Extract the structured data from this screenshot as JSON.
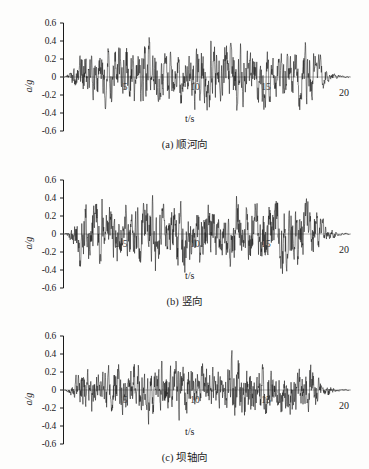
{
  "figure": {
    "background_color": "#fdfdfc",
    "ink_color": "#1a1a1a",
    "baseline_color": "#9a9a9a"
  },
  "axis": {
    "y_label_text": "a/g",
    "x_label_text": "t/s",
    "y_ticks": [
      "0.6",
      "0.4",
      "0.2",
      "0",
      "-0.2",
      "-0.4",
      "-0.6"
    ],
    "x_ticks": [
      "5",
      "10",
      "15"
    ],
    "x_end_label": "20",
    "y_min": -0.6,
    "y_max": 0.6,
    "x_min": 0,
    "x_max": 20
  },
  "panels": [
    {
      "id": "a",
      "caption_index": "(a)",
      "caption_text": "顺河向",
      "seed": 1733,
      "peak": 0.44,
      "trough": -0.42
    },
    {
      "id": "b",
      "caption_index": "(b)",
      "caption_text": "竖向",
      "seed": 90217,
      "peak": 0.43,
      "trough": -0.45
    },
    {
      "id": "c",
      "caption_index": "(c)",
      "caption_text": "坝轴向",
      "seed": 44501,
      "peak": 0.44,
      "trough": -0.42
    }
  ],
  "chart_data": {
    "type": "line",
    "title": "",
    "xlabel": "t/s",
    "ylabel": "a/g",
    "xlim": [
      0,
      20
    ],
    "ylim": [
      -0.6,
      0.6
    ],
    "grid": false,
    "legend": "none",
    "x_tick_values": [
      5,
      10,
      15,
      20
    ],
    "y_tick_values": [
      -0.6,
      -0.4,
      -0.2,
      0,
      0.2,
      0.4,
      0.6
    ],
    "series": [
      {
        "name": "(a) 顺河向",
        "description": "Acceleration time history, stream-flow direction",
        "sampling_interval_s": 0.02,
        "duration_s": 20,
        "peak_positive_g": 0.44,
        "peak_negative_g": -0.42,
        "envelope_description": "noise burst rising to full amplitude by ~1.5 s, sustained to ~17 s, decaying to near zero at 20 s",
        "values_note": "dense random seismic trace; reconstructed procedurally from seed with matching envelope and peak amplitudes"
      },
      {
        "name": "(b) 竖向",
        "description": "Acceleration time history, vertical direction",
        "sampling_interval_s": 0.02,
        "duration_s": 20,
        "peak_positive_g": 0.43,
        "peak_negative_g": -0.45,
        "envelope_description": "noise burst rising to full amplitude by ~1.5 s, sustained to ~17.5 s, decaying to near zero at 20 s",
        "values_note": "dense random seismic trace; reconstructed procedurally from seed with matching envelope and peak amplitudes"
      },
      {
        "name": "(c) 坝轴向",
        "description": "Acceleration time history, dam-axis direction",
        "sampling_interval_s": 0.02,
        "duration_s": 20,
        "peak_positive_g": 0.44,
        "peak_negative_g": -0.42,
        "envelope_description": "noise burst rising to full amplitude by ~1.5 s, sustained to ~18 s, decaying to near zero at 20 s",
        "values_note": "dense random seismic trace; reconstructed procedurally from seed with matching envelope and peak amplitudes"
      }
    ]
  }
}
